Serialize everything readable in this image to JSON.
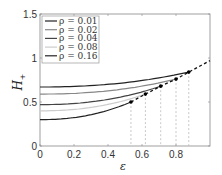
{
  "chart_data": {
    "type": "line",
    "title": "",
    "xlabel": "ε",
    "ylabel": "H+",
    "xlim": [
      0,
      1.0
    ],
    "ylim": [
      0,
      1.5
    ],
    "xticks": [
      0,
      0.2,
      0.4,
      0.6,
      0.8
    ],
    "xtick_labels": [
      "0",
      "0.2",
      "0.4",
      "0.6",
      "0.8"
    ],
    "yticks": [
      0,
      0.5,
      1,
      1.5
    ],
    "ytick_labels": [
      "0",
      "0.5",
      "1",
      "1.5"
    ],
    "grid": false,
    "legend_position": "upper left",
    "series": [
      {
        "name": "ρ = 0.01",
        "color": "#222222",
        "start_y": 0.67,
        "end_x": 0.875,
        "end_y": 0.84
      },
      {
        "name": "ρ = 0.02",
        "color": "#888888",
        "start_y": 0.59,
        "end_x": 0.8,
        "end_y": 0.76
      },
      {
        "name": "ρ = 0.04",
        "color": "#444444",
        "start_y": 0.47,
        "end_x": 0.71,
        "end_y": 0.68
      },
      {
        "name": "ρ = 0.08",
        "color": "#cccccc",
        "start_y": 0.4,
        "end_x": 0.62,
        "end_y": 0.59
      },
      {
        "name": "ρ = 0.16",
        "color": "#222222",
        "start_y": 0.3,
        "end_x": 0.535,
        "end_y": 0.5
      }
    ],
    "envelope": {
      "style": "dashed",
      "points": [
        [
          0.535,
          0.5
        ],
        [
          0.62,
          0.59
        ],
        [
          0.71,
          0.68
        ],
        [
          0.8,
          0.76
        ],
        [
          0.875,
          0.84
        ],
        [
          1.0,
          0.97
        ]
      ]
    }
  }
}
